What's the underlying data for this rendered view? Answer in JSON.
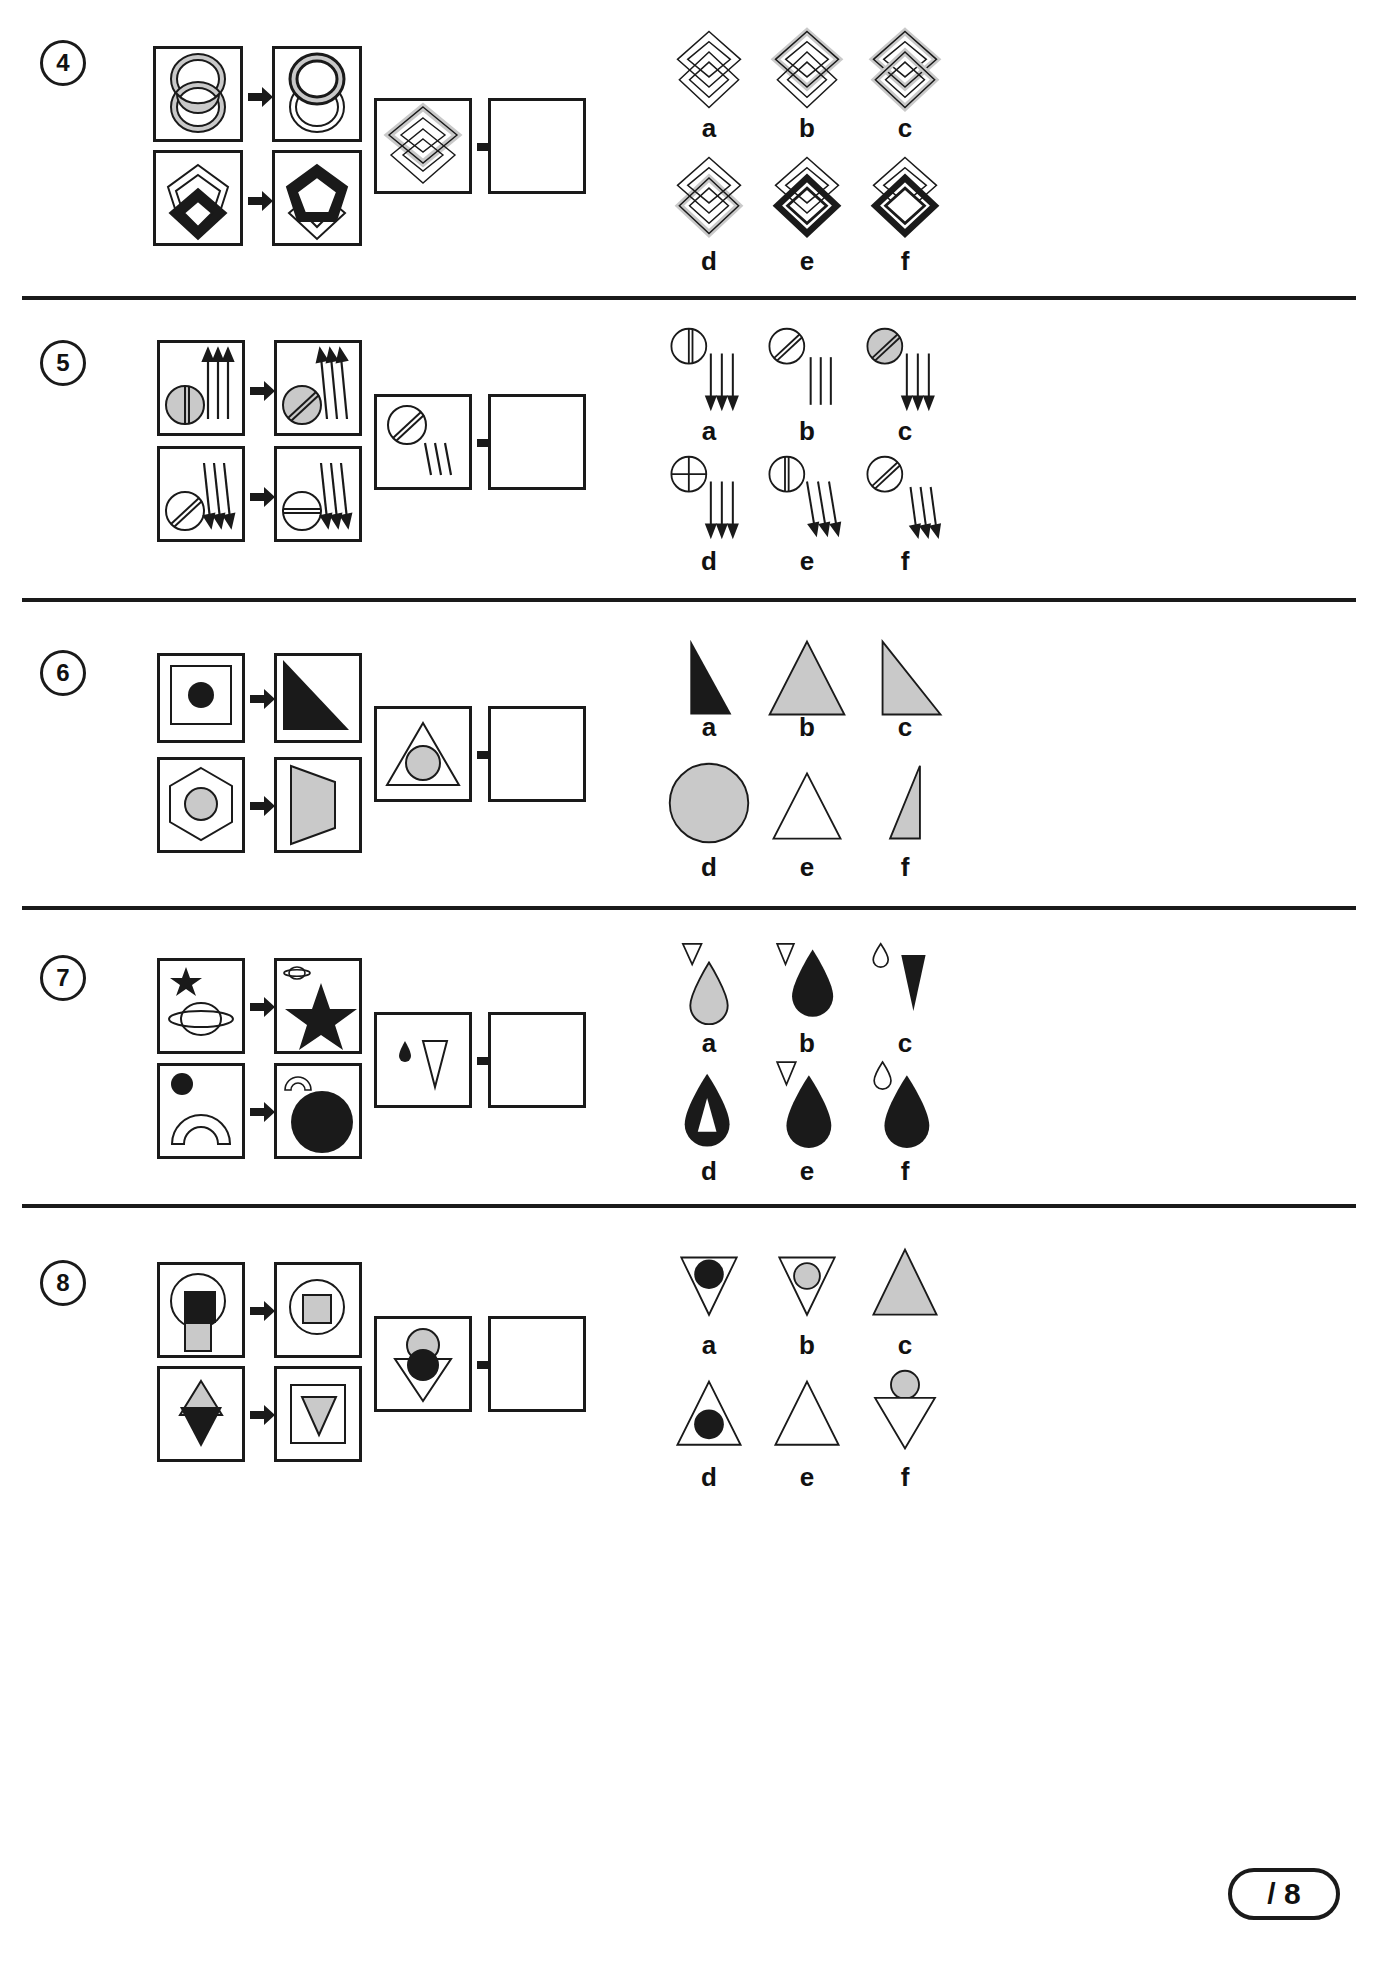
{
  "page": {
    "width": 1378,
    "height": 1987,
    "colors": {
      "ink": "#1a1a1a",
      "gray_fill": "#c9c9c9",
      "black_fill": "#1a1a1a",
      "white_fill": "#ffffff",
      "background": "#ffffff"
    }
  },
  "score": {
    "label": "/ 8",
    "name": "score-box"
  },
  "questions": [
    {
      "number": "4",
      "option_labels": [
        "a",
        "b",
        "c",
        "d",
        "e",
        "f"
      ],
      "example_top": {
        "from": "two-interlocking-ellipse-rings-gray",
        "to": "two-interlocking-ellipse-rings-gray-top-thick"
      },
      "example_bottom": {
        "from": "pentagon-outline-with-black-diamond",
        "to": "pentagon-black-thick-with-outline-diamond"
      },
      "prompt": "two-interlocking-diamonds-gray-top",
      "answer_slot_empty": true
    },
    {
      "number": "5",
      "option_labels": [
        "a",
        "b",
        "c",
        "d",
        "e",
        "f"
      ],
      "example_top": {
        "from": "gray-circle-vertical-line-three-up-arrows",
        "to": "gray-circle-diagonal-line-three-up-arrows-tilted"
      },
      "example_bottom": {
        "from": "white-circle-diagonal-line-three-down-arrows",
        "to": "white-circle-horizontal-line-three-down-arrows-tilted"
      },
      "prompt": "white-circle-diagonal-line-three-down-lines",
      "answer_slot_empty": true
    },
    {
      "number": "6",
      "option_labels": [
        "a",
        "b",
        "c",
        "d",
        "e",
        "f"
      ],
      "example_top": {
        "from": "square-outline-with-black-circle",
        "to": "black-right-triangle"
      },
      "example_bottom": {
        "from": "hexagon-outline-with-gray-circle",
        "to": "gray-trapezoid"
      },
      "prompt": "triangle-outline-with-gray-circle",
      "answer_slot_empty": true
    },
    {
      "number": "7",
      "option_labels": [
        "a",
        "b",
        "c",
        "d",
        "e",
        "f"
      ],
      "example_top": {
        "from": "small-black-star-and-large-saturn-outline",
        "to": "small-saturn-outline-and-large-black-star"
      },
      "example_bottom": {
        "from": "small-black-circle-and-large-arch-outline",
        "to": "small-arch-outline-and-large-black-circle"
      },
      "prompt": "small-black-droplet-and-large-triangle-outline",
      "answer_slot_empty": true
    },
    {
      "number": "8",
      "option_labels": [
        "a",
        "b",
        "c",
        "d",
        "e",
        "f"
      ],
      "example_top": {
        "from": "circle-outline-black-square-and-gray-square",
        "to": "circle-outline-with-gray-square-inside"
      },
      "example_bottom": {
        "from": "gray-triangle-up-and-black-triangle-down",
        "to": "gray-triangle-down-inside-square"
      },
      "prompt": "gray-circle-above-black-circle-in-down-triangle",
      "answer_slot_empty": true
    }
  ]
}
